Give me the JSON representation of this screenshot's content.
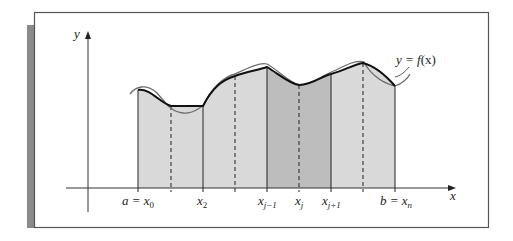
{
  "figure": {
    "type": "trapezoidal-rule-diagram",
    "colors": {
      "frame": "#555555",
      "shadow": "#8a8a8a",
      "fill_light": "#d9d9d9",
      "fill_dark": "#bdbdbd",
      "curve_true": "#6e6e6e",
      "curve_approx": "#111111",
      "axis": "#333333"
    },
    "axes": {
      "x_label": "x",
      "y_label": "y"
    },
    "function_label": {
      "lhs": "y = ",
      "f": "f",
      "arg": "(x)"
    },
    "tick_labels": {
      "a_x0": {
        "main": "a = x",
        "sub": "0"
      },
      "x2": {
        "main": "x",
        "sub": "2"
      },
      "xj_minus_1": {
        "main": "x",
        "sub": "j−1"
      },
      "xj": {
        "main": "x",
        "sub": "j"
      },
      "xj_plus_1": {
        "main": "x",
        "sub": "j+1"
      },
      "b_xn": {
        "main": "b = x",
        "sub": "n"
      }
    },
    "partition": {
      "solid_nodes": [
        "a = x0",
        "x2",
        "x(j−1)",
        "x(j+1)",
        "b = xn"
      ],
      "dashed_nodes": [
        "x1",
        "x3",
        "xj",
        "x(j+2)"
      ]
    }
  }
}
